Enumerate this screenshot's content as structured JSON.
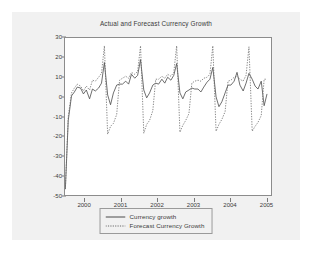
{
  "chart_data": {
    "type": "line",
    "title": "Actual and Forecast Currency Growth",
    "xlabel": "",
    "ylabel": "",
    "ylim": [
      -50,
      30
    ],
    "xlim": [
      1999.45,
      2005.15
    ],
    "yticks": [
      30,
      20,
      10,
      0,
      -10,
      -20,
      -30,
      -40,
      -50
    ],
    "ytick_labels": [
      "30",
      "20",
      "10",
      "0",
      "-10",
      "-20",
      "-30",
      "-40",
      "-50"
    ],
    "xticks": [
      2000,
      2001,
      2002,
      2003,
      2004,
      2005
    ],
    "xtick_labels": [
      "2000",
      "2001",
      "2002",
      "2003",
      "2004",
      "2005"
    ],
    "grid": false,
    "legend_position": "below-center",
    "series": [
      {
        "name": "Currency growth",
        "style": "solid",
        "color": "#4a4a4a",
        "x": [
          1999.46,
          1999.54,
          1999.63,
          1999.71,
          1999.79,
          1999.88,
          1999.96,
          2000.04,
          2000.13,
          2000.21,
          2000.29,
          2000.38,
          2000.46,
          2000.54,
          2000.63,
          2000.71,
          2000.79,
          2000.88,
          2000.96,
          2001.04,
          2001.13,
          2001.21,
          2001.29,
          2001.38,
          2001.46,
          2001.54,
          2001.63,
          2001.71,
          2001.79,
          2001.88,
          2001.96,
          2002.04,
          2002.13,
          2002.21,
          2002.29,
          2002.38,
          2002.46,
          2002.54,
          2002.63,
          2002.71,
          2002.79,
          2002.88,
          2002.96,
          2003.04,
          2003.13,
          2003.21,
          2003.29,
          2003.38,
          2003.46,
          2003.54,
          2003.63,
          2003.71,
          2003.79,
          2003.88,
          2003.96,
          2004.04,
          2004.13,
          2004.21,
          2004.29,
          2004.38,
          2004.46,
          2004.54,
          2004.63,
          2004.71,
          2004.79,
          2004.88,
          2004.96,
          2005.04
        ],
        "values": [
          -47,
          -12,
          0.5,
          2.5,
          5,
          4.5,
          1.5,
          3.5,
          -1,
          4,
          3,
          4.5,
          7,
          17.5,
          1,
          -4,
          2,
          6,
          6.5,
          6.5,
          8,
          6.5,
          11.5,
          9.5,
          11,
          19,
          3.5,
          -0.5,
          2,
          6,
          7,
          6.5,
          9,
          7,
          10,
          8.5,
          11,
          17,
          2,
          -1,
          2.5,
          3.5,
          4.5,
          4,
          4,
          2.5,
          5,
          7.5,
          9,
          15,
          0,
          -5,
          -2.5,
          2,
          6,
          6,
          8,
          12.5,
          6,
          3,
          7,
          12,
          9,
          5.5,
          4,
          8,
          -4.5,
          1.5
        ]
      },
      {
        "name": "Forecast Currency Growth",
        "style": "dotted",
        "color": "#6a6a6a",
        "x": [
          1999.46,
          1999.54,
          1999.63,
          1999.71,
          1999.79,
          1999.88,
          1999.96,
          2000.04,
          2000.13,
          2000.21,
          2000.29,
          2000.38,
          2000.46,
          2000.54,
          2000.63,
          2000.71,
          2000.79,
          2000.88,
          2000.96,
          2001.04,
          2001.13,
          2001.21,
          2001.29,
          2001.38,
          2001.46,
          2001.54,
          2001.63,
          2001.71,
          2001.79,
          2001.88,
          2001.96,
          2002.04,
          2002.13,
          2002.21,
          2002.29,
          2002.38,
          2002.46,
          2002.54,
          2002.63,
          2002.71,
          2002.79,
          2002.88,
          2002.96,
          2003.04,
          2003.13,
          2003.21,
          2003.29,
          2003.38,
          2003.46,
          2003.54,
          2003.63,
          2003.71,
          2003.79,
          2003.88,
          2003.96,
          2004.04,
          2004.13,
          2004.21,
          2004.29,
          2004.38,
          2004.46,
          2004.54,
          2004.63,
          2004.71,
          2004.79,
          2004.88,
          2004.96,
          2005.04
        ],
        "values": [
          -47,
          -10,
          2,
          4.5,
          6.5,
          5.5,
          3,
          5.5,
          3.5,
          8.5,
          8,
          10,
          12,
          26,
          -19,
          -15,
          -13.5,
          -9,
          8.5,
          9.5,
          10.5,
          9.5,
          12.5,
          11.5,
          13,
          26,
          -18.5,
          -14,
          -12,
          -7,
          9,
          9,
          10.5,
          9.5,
          11.5,
          10.5,
          12.5,
          26,
          -18,
          -14.5,
          -12,
          -8.5,
          7,
          8,
          8.5,
          8,
          9.5,
          10,
          11.5,
          26,
          -17.5,
          -14,
          -11.5,
          -7.5,
          8,
          8.5,
          10,
          10.5,
          9,
          8,
          11,
          25.5,
          -17.5,
          -15,
          -13,
          -9.5,
          9,
          9
        ]
      }
    ]
  },
  "legend": {
    "items": [
      {
        "label": "Currency growth",
        "style": "solid"
      },
      {
        "label": "Forecast Currency Growth",
        "style": "dotted"
      }
    ]
  }
}
